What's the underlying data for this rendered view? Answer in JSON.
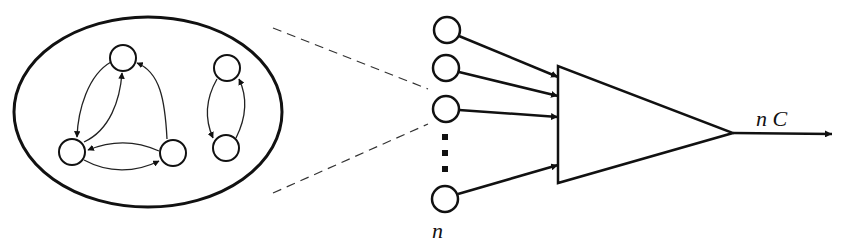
{
  "diagram": {
    "type": "network-to-summation",
    "colors": {
      "stroke": "#111111",
      "background": "#ffffff",
      "dashed": "#333333"
    },
    "cluster": {
      "shape": "ellipse",
      "nodes": [
        {
          "id": "a",
          "cx": 123,
          "cy": 58
        },
        {
          "id": "b",
          "cx": 72,
          "cy": 152
        },
        {
          "id": "c",
          "cx": 173,
          "cy": 153
        },
        {
          "id": "d",
          "cx": 227,
          "cy": 68
        },
        {
          "id": "e",
          "cx": 226,
          "cy": 148
        }
      ],
      "edges": [
        {
          "from": "a",
          "to": "b"
        },
        {
          "from": "b",
          "to": "a"
        },
        {
          "from": "c",
          "to": "a"
        },
        {
          "from": "b",
          "to": "c"
        },
        {
          "from": "c",
          "to": "b"
        },
        {
          "from": "d",
          "to": "e"
        },
        {
          "from": "e",
          "to": "d"
        }
      ]
    },
    "inputs": {
      "count_label": "n",
      "nodes": [
        {
          "cx": 447,
          "cy": 30
        },
        {
          "cx": 446,
          "cy": 68
        },
        {
          "cx": 446,
          "cy": 109
        },
        {
          "cx": 445,
          "cy": 199
        }
      ],
      "ellipsis": "vertical dots"
    },
    "summation": {
      "shape": "triangle"
    },
    "output": {
      "label": "n C"
    }
  }
}
